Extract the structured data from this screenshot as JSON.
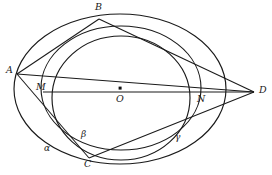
{
  "figure": {
    "kind": "geometry-diagram",
    "width": 272,
    "height": 175,
    "background_color": "#ffffff",
    "stroke_color": "#1a1a1a"
  },
  "points": [
    {
      "id": "A",
      "label": "A",
      "x": 17,
      "y": 74,
      "label_x": 6,
      "label_y": 68,
      "marked": false
    },
    {
      "id": "B",
      "label": "B",
      "x": 99,
      "y": 19,
      "label_x": 95,
      "label_y": 4,
      "marked": false
    },
    {
      "id": "C",
      "label": "C",
      "x": 89,
      "y": 158,
      "label_x": 85,
      "label_y": 160,
      "marked": false
    },
    {
      "id": "D",
      "label": "D",
      "x": 254,
      "y": 92,
      "label_x": 259,
      "label_y": 87,
      "marked": false
    },
    {
      "id": "M",
      "label": "M",
      "x": 43,
      "y": 92,
      "label_x": 37,
      "label_y": 84,
      "marked": false
    },
    {
      "id": "N",
      "label": "N",
      "x": 200,
      "y": 92,
      "label_x": 197,
      "label_y": 94,
      "marked": false
    },
    {
      "id": "O",
      "label": "O",
      "x": 120,
      "y": 88,
      "label_x": 116,
      "label_y": 94,
      "marked": true
    }
  ],
  "curves": [
    {
      "id": "alpha",
      "label": "α",
      "type": "ellipse",
      "cx": 120,
      "cy": 89,
      "rx": 106,
      "ry": 75,
      "rotation": 0,
      "label_x": 44,
      "label_y": 146
    },
    {
      "id": "middle-circle",
      "label": "",
      "type": "circle",
      "cx": 121,
      "cy": 98,
      "rx": 69,
      "ry": 62,
      "rotation": 0,
      "label_x": 0,
      "label_y": 0
    },
    {
      "id": "beta",
      "label": "β",
      "type": "ellipse",
      "cx": 121,
      "cy": 88,
      "rx": 80,
      "ry": 62,
      "rotation": 0,
      "label_x": 81,
      "label_y": 132
    },
    {
      "id": "gamma",
      "label": "γ",
      "type": "arc-label-only",
      "cx": 0,
      "cy": 0,
      "rx": 0,
      "ry": 0,
      "rotation": 0,
      "label_x": 175,
      "label_y": 135
    }
  ],
  "chords": [
    {
      "id": "A-B",
      "from": "A",
      "to": "B"
    },
    {
      "id": "A-C",
      "from": "A",
      "to": "C"
    },
    {
      "id": "A-D",
      "from": "A",
      "to": "D"
    },
    {
      "id": "B-D",
      "from": "B",
      "to": "D"
    },
    {
      "id": "C-D",
      "from": "C",
      "to": "D"
    },
    {
      "id": "M-D",
      "from": "M",
      "to": "D"
    }
  ],
  "axis": {
    "id": "axis-MN",
    "from": "M",
    "to": "N",
    "label": "M-O-N horizontal axis"
  },
  "labels": {
    "A": "A",
    "B": "B",
    "C": "C",
    "D": "D",
    "M": "M",
    "N": "N",
    "O": "O",
    "alpha": "α",
    "beta": "β",
    "gamma": "γ"
  }
}
